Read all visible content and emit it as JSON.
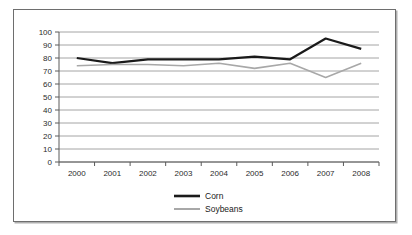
{
  "chart_data": {
    "type": "line",
    "title": "",
    "subtitle": "",
    "xlabel": "",
    "ylabel": "",
    "categories": [
      "2000",
      "2001",
      "2002",
      "2003",
      "2004",
      "2005",
      "2006",
      "2007",
      "2008"
    ],
    "series": [
      {
        "name": "Corn",
        "color": "#1a1a1a",
        "line_width": 2.2,
        "values": [
          80,
          76,
          79,
          79,
          79,
          81,
          79,
          95,
          87
        ]
      },
      {
        "name": "Soybeans",
        "color": "#a8a8a8",
        "line_width": 1.6,
        "values": [
          74,
          75,
          75,
          74,
          76,
          72,
          76,
          65,
          76
        ]
      }
    ],
    "yticks": [
      0,
      10,
      20,
      30,
      40,
      50,
      60,
      70,
      80,
      90,
      100
    ],
    "ylim": [
      0,
      100
    ],
    "grid": true,
    "grid_axis": "y",
    "legend_position": "bottom-center",
    "legend_entries": [
      "Corn",
      "Soybeans"
    ]
  },
  "colors": {
    "corn_line": "#1a1a1a",
    "soybeans_line": "#a8a8a8",
    "gridline": "#9a9a9a",
    "axis": "#5a5a5a",
    "frame_border": "#6e6e6e",
    "background": "#ffffff",
    "tick_text": "#2b2b2b"
  }
}
